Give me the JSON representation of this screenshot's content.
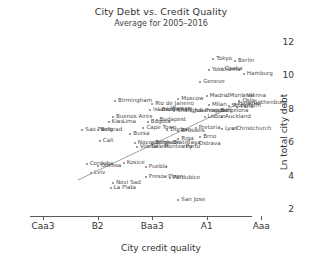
{
  "chart_data": {
    "type": "scatter",
    "title": "City Debt vs. Credit Quality",
    "subtitle": "Average for 2005–2016",
    "xlabel": "City credit quality",
    "ylabel": "Ln total city debt",
    "xticklabels": [
      "Caa3",
      "B2",
      "Baa3",
      "A1",
      "Aaa"
    ],
    "xtickvalues": [
      0,
      25,
      50,
      75,
      100
    ],
    "yticklabels": [
      "2",
      "4",
      "6",
      "8",
      "10",
      "12"
    ],
    "ytickvalues": [
      2,
      4,
      6,
      8,
      10,
      12
    ],
    "ylim": [
      1.6,
      12.6
    ],
    "xlim": [
      -6,
      104
    ],
    "grid": false,
    "legend": null,
    "trendline": {
      "x0": 16,
      "y0": 3.75,
      "x1": 90,
      "y1": 8.35
    },
    "points": [
      {
        "label": "Tokyo",
        "x": 78,
        "y": 11.0
      },
      {
        "label": "Berlin",
        "x": 88,
        "y": 10.85
      },
      {
        "label": "Yokohama",
        "x": 76,
        "y": 10.3
      },
      {
        "label": "Osaka",
        "x": 82,
        "y": 10.4
      },
      {
        "label": "Hamburg",
        "x": 92,
        "y": 10.1
      },
      {
        "label": "Geneve",
        "x": 72,
        "y": 9.6
      },
      {
        "label": "Madrid",
        "x": 75,
        "y": 8.75
      },
      {
        "label": "Montreal",
        "x": 84,
        "y": 8.75
      },
      {
        "label": "Vienna",
        "x": 92,
        "y": 8.8
      },
      {
        "label": "Moscow",
        "x": 62,
        "y": 8.6
      },
      {
        "label": "Oslo",
        "x": 90,
        "y": 8.5
      },
      {
        "label": "Gothenburg",
        "x": 95,
        "y": 8.35
      },
      {
        "label": "Birmingham",
        "x": 33,
        "y": 8.45
      },
      {
        "label": "Milan",
        "x": 76,
        "y": 8.25
      },
      {
        "label": "Helsinki",
        "x": 88,
        "y": 8.3
      },
      {
        "label": "Rio de Janeiro",
        "x": 50,
        "y": 8.3
      },
      {
        "label": "Paris",
        "x": 89,
        "y": 8.1
      },
      {
        "label": "Stockholm",
        "x": 85,
        "y": 8.15
      },
      {
        "label": "Istanbul",
        "x": 49,
        "y": 7.95
      },
      {
        "label": "Warsaw",
        "x": 57,
        "y": 8.0
      },
      {
        "label": "Shanghai",
        "x": 60,
        "y": 7.9
      },
      {
        "label": "Bucharest",
        "x": 53,
        "y": 7.95
      },
      {
        "label": "Prague",
        "x": 73,
        "y": 7.85
      },
      {
        "label": "Johannesburg",
        "x": 68,
        "y": 7.9
      },
      {
        "label": "Barcelona",
        "x": 80,
        "y": 7.9
      },
      {
        "label": "Buenos Aires",
        "x": 32,
        "y": 7.5
      },
      {
        "label": "Auckland",
        "x": 82,
        "y": 7.5
      },
      {
        "label": "Lisbon",
        "x": 74,
        "y": 7.5
      },
      {
        "label": "Budapest",
        "x": 52,
        "y": 7.35
      },
      {
        "label": "Kiev",
        "x": 30,
        "y": 7.2
      },
      {
        "label": "Lima",
        "x": 35,
        "y": 7.2
      },
      {
        "label": "Bogota",
        "x": 48,
        "y": 7.2
      },
      {
        "label": "Sao Paulo",
        "x": 18,
        "y": 6.75
      },
      {
        "label": "Belgrad",
        "x": 25,
        "y": 6.75
      },
      {
        "label": "Cape Town",
        "x": 46,
        "y": 6.85
      },
      {
        "label": "Pretoria",
        "x": 70,
        "y": 6.85
      },
      {
        "label": "Christchurch",
        "x": 87,
        "y": 6.8
      },
      {
        "label": "Lyon",
        "x": 82,
        "y": 6.8
      },
      {
        "label": "Durban",
        "x": 57,
        "y": 6.75
      },
      {
        "label": "Brussels",
        "x": 62,
        "y": 6.7
      },
      {
        "label": "Bursa",
        "x": 40,
        "y": 6.5
      },
      {
        "label": "Brno",
        "x": 72,
        "y": 6.35
      },
      {
        "label": "Riga",
        "x": 62,
        "y": 6.2
      },
      {
        "label": "Cali",
        "x": 26,
        "y": 6.1
      },
      {
        "label": "Novosibirsk",
        "x": 42,
        "y": 5.95
      },
      {
        "label": "Belgrade",
        "x": 50,
        "y": 5.95
      },
      {
        "label": "Bratislava",
        "x": 58,
        "y": 5.95
      },
      {
        "label": "Ostrava",
        "x": 70,
        "y": 5.9
      },
      {
        "label": "Porto",
        "x": 64,
        "y": 5.75
      },
      {
        "label": "Vilnius",
        "x": 43,
        "y": 5.7
      },
      {
        "label": "Tallinn",
        "x": 48,
        "y": 5.7
      },
      {
        "label": "Monterrey",
        "x": 54,
        "y": 5.7
      },
      {
        "label": "Cordoba",
        "x": 20,
        "y": 4.7
      },
      {
        "label": "Odessa",
        "x": 25,
        "y": 4.6
      },
      {
        "label": "Kosice",
        "x": 37,
        "y": 4.75
      },
      {
        "label": "Puebla",
        "x": 47,
        "y": 4.5
      },
      {
        "label": "Lviv",
        "x": 22,
        "y": 4.15
      },
      {
        "label": "Presov",
        "x": 47,
        "y": 3.95
      },
      {
        "label": "Plzen",
        "x": 56,
        "y": 3.95
      },
      {
        "label": "Pardubice",
        "x": 58,
        "y": 3.9
      },
      {
        "label": "Novi Sad",
        "x": 32,
        "y": 3.6
      },
      {
        "label": "La Plata",
        "x": 31,
        "y": 3.25
      },
      {
        "label": "San Jose",
        "x": 62,
        "y": 2.55
      }
    ]
  }
}
